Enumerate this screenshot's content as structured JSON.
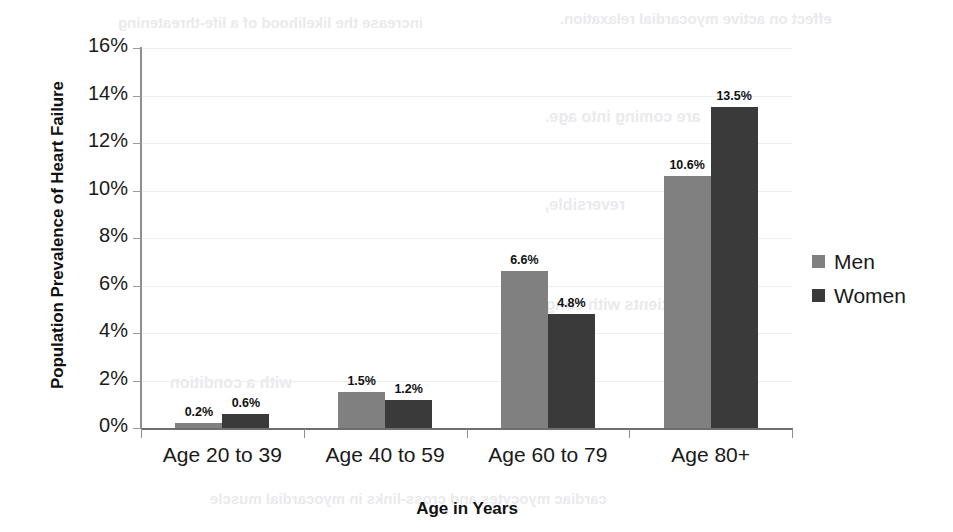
{
  "chart_data": {
    "type": "bar",
    "title": "",
    "xlabel": "Age in Years",
    "ylabel": "Population Prevalence of Heart Failure",
    "categories": [
      "Age 20 to 39",
      "Age 40 to 59",
      "Age 60 to 79",
      "Age 80+"
    ],
    "series": [
      {
        "name": "Men",
        "color": "#808080",
        "values": [
          0.2,
          1.5,
          6.6,
          10.6
        ],
        "labels": [
          "0.2%",
          "1.5%",
          "6.6%",
          "10.6%"
        ]
      },
      {
        "name": "Women",
        "color": "#3a3a3a",
        "values": [
          0.6,
          1.2,
          4.8,
          13.5
        ],
        "labels": [
          "0.6%",
          "1.2%",
          "4.8%",
          "13.5%"
        ]
      }
    ],
    "ylim": [
      0,
      16
    ],
    "ytick_values": [
      0,
      2,
      4,
      6,
      8,
      10,
      12,
      14,
      16
    ],
    "ytick_labels": [
      "0%",
      "2%",
      "4%",
      "6%",
      "8%",
      "10%",
      "12%",
      "14%",
      "16%"
    ],
    "grid": true,
    "grid_axis": "y",
    "legend_position": "right",
    "value_labels": true,
    "units": "percent"
  },
  "background_bleed": [
    {
      "text": "increase the likelihood of a life-threatening",
      "left": 118,
      "top": 14,
      "size": 15
    },
    {
      "text": "effect on active myocardial relaxation.",
      "left": 560,
      "top": 10,
      "size": 15
    },
    {
      "text": "are coming into age.",
      "left": 545,
      "top": 108,
      "size": 16
    },
    {
      "text": "reversible,",
      "left": 545,
      "top": 196,
      "size": 16
    },
    {
      "text": "patients with congestive",
      "left": 500,
      "top": 296,
      "size": 16
    },
    {
      "text": "with a condition",
      "left": 170,
      "top": 374,
      "size": 16
    },
    {
      "text": "cardiac myocytes and cross-links in myocardial muscle",
      "left": 210,
      "top": 490,
      "size": 15
    }
  ]
}
